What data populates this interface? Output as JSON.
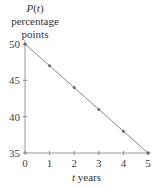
{
  "chart_data": {
    "type": "line",
    "title": "",
    "ylabel_lines": [
      "P(t)",
      "percentage",
      "points"
    ],
    "ylabel_func": "P",
    "ylabel_var": "t",
    "xlabel_var": "t",
    "xlabel_unit": "years",
    "x": [
      0,
      1,
      2,
      3,
      4,
      5
    ],
    "values": [
      50,
      47,
      44,
      41,
      38,
      35
    ],
    "xlim": [
      0,
      5
    ],
    "ylim": [
      35,
      50
    ],
    "xticks": [
      "0",
      "1",
      "2",
      "3",
      "4",
      "5"
    ],
    "yticks": [
      "35",
      "40",
      "45",
      "50"
    ],
    "grid": false,
    "legend": null,
    "line_color": "#888888",
    "marker_color": "#666666"
  }
}
